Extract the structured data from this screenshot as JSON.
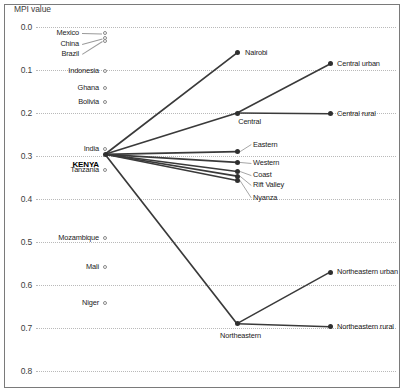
{
  "chart_data": {
    "type": "line",
    "title": "",
    "ylabel": "MPI value",
    "xlabel": "",
    "ylim": [
      0.0,
      0.8
    ],
    "y_inverted": true,
    "grid": true,
    "legend_position": "none",
    "y_ticks": [
      "0.0",
      "0.1",
      "0.2",
      "0.3",
      "0.4",
      "0.5",
      "0.6",
      "0.7",
      "0.8"
    ],
    "y_tick_values": [
      0.0,
      0.1,
      0.2,
      0.3,
      0.4,
      0.5,
      0.6,
      0.7,
      0.8
    ],
    "reference_countries": [
      {
        "label": "Mexico",
        "value": 0.015,
        "marker": "hollow"
      },
      {
        "label": "China",
        "value": 0.026,
        "marker": "hollow"
      },
      {
        "label": "Brazil",
        "value": 0.033,
        "marker": "hollow"
      },
      {
        "label": "Indonesia",
        "value": 0.102,
        "marker": "hollow"
      },
      {
        "label": "Ghana",
        "value": 0.141,
        "marker": "hollow"
      },
      {
        "label": "Bolivia",
        "value": 0.174,
        "marker": "hollow"
      },
      {
        "label": "India",
        "value": 0.283,
        "marker": "hollow"
      },
      {
        "label": "Tanzania",
        "value": 0.332,
        "marker": "hollow"
      },
      {
        "label": "Mozambique",
        "value": 0.49,
        "marker": "hollow"
      },
      {
        "label": "Mali",
        "value": 0.558,
        "marker": "hollow"
      },
      {
        "label": "Niger",
        "value": 0.642,
        "marker": "hollow"
      }
    ],
    "national": {
      "label": "KENYA",
      "value": 0.296
    },
    "regions": [
      {
        "label": "Nairobi",
        "value": 0.06
      },
      {
        "label": "Central",
        "value": 0.2
      },
      {
        "label": "Eastern",
        "value": 0.29
      },
      {
        "label": "Western",
        "value": 0.315
      },
      {
        "label": "Coast",
        "value": 0.336
      },
      {
        "label": "Rift Valley",
        "value": 0.347
      },
      {
        "label": "Nyanza",
        "value": 0.357
      },
      {
        "label": "Northeastern",
        "value": 0.69
      }
    ],
    "sub_regions": [
      {
        "label": "Central urban",
        "parent": "Central",
        "value": 0.086
      },
      {
        "label": "Central rural",
        "parent": "Central",
        "value": 0.202
      },
      {
        "label": "Northeastern urban",
        "parent": "Northeastern",
        "value": 0.57
      },
      {
        "label": "Northeastern rural",
        "parent": "Northeastern",
        "value": 0.697
      }
    ]
  }
}
